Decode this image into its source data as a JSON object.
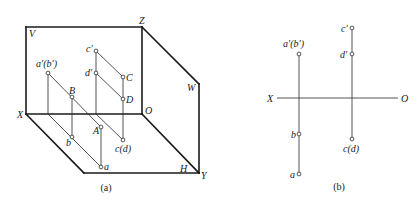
{
  "figure_a": {
    "caption": "(a)",
    "caption_pos": [
      106,
      191
    ],
    "frame_lines": [
      {
        "name": "v-plane-top",
        "p": [
          26,
          27,
          142,
          27
        ]
      },
      {
        "name": "v-plane-left",
        "p": [
          26,
          27,
          26,
          114
        ]
      },
      {
        "name": "z-axis",
        "p": [
          142,
          27,
          142,
          114
        ]
      },
      {
        "name": "x-axis",
        "p": [
          26,
          114,
          142,
          114
        ]
      },
      {
        "name": "w-plane-top",
        "p": [
          142,
          27,
          199,
          84
        ]
      },
      {
        "name": "w-plane-right",
        "p": [
          199,
          84,
          199,
          173
        ]
      },
      {
        "name": "y-axis",
        "p": [
          142,
          114,
          199,
          173
        ]
      },
      {
        "name": "h-plane-left",
        "p": [
          26,
          114,
          84,
          173
        ]
      },
      {
        "name": "h-plane-bottom",
        "p": [
          84,
          173,
          199,
          173
        ]
      }
    ],
    "thin_lines": [
      {
        "name": "ab-line-space",
        "p": [
          48,
          73,
          101,
          127
        ]
      },
      {
        "name": "ab-line-horizontal-projection",
        "p": [
          48,
          114,
          101,
          167
        ]
      },
      {
        "name": "a-prime-projector",
        "p": [
          48,
          73,
          48,
          114
        ]
      },
      {
        "name": "b-projector",
        "p": [
          72,
          97,
          72,
          137
        ]
      },
      {
        "name": "a-projector",
        "p": [
          101,
          127,
          101,
          167
        ]
      },
      {
        "name": "c-prime-c-line",
        "p": [
          96,
          51,
          123,
          77
        ]
      },
      {
        "name": "d-prime-d-line",
        "p": [
          96,
          73,
          123,
          99
        ]
      },
      {
        "name": "cd-horizontal-projection",
        "p": [
          96,
          114,
          123,
          140
        ]
      },
      {
        "name": "c-prime-projector",
        "p": [
          96,
          51,
          96,
          114
        ]
      },
      {
        "name": "cd-projector",
        "p": [
          123,
          77,
          123,
          140
        ]
      }
    ],
    "points": [
      {
        "name": "a-prime-b-prime",
        "x": 48,
        "y": 73
      },
      {
        "name": "B",
        "x": 72,
        "y": 97
      },
      {
        "name": "A",
        "x": 101,
        "y": 127
      },
      {
        "name": "b",
        "x": 72,
        "y": 137
      },
      {
        "name": "a",
        "x": 101,
        "y": 167
      },
      {
        "name": "c-prime",
        "x": 96,
        "y": 51
      },
      {
        "name": "d-prime",
        "x": 96,
        "y": 73
      },
      {
        "name": "C",
        "x": 123,
        "y": 77
      },
      {
        "name": "D",
        "x": 123,
        "y": 99
      },
      {
        "name": "c-d",
        "x": 123,
        "y": 140
      }
    ],
    "labels": [
      {
        "name": "label-V",
        "text": "V",
        "x": 29,
        "y": 37
      },
      {
        "name": "label-Z",
        "text": "Z",
        "x": 139,
        "y": 24
      },
      {
        "name": "label-W",
        "text": "W",
        "x": 187,
        "y": 91
      },
      {
        "name": "label-X",
        "text": "X",
        "x": 17,
        "y": 118
      },
      {
        "name": "label-O",
        "text": "O",
        "x": 145,
        "y": 114
      },
      {
        "name": "label-H",
        "text": "H",
        "x": 180,
        "y": 172
      },
      {
        "name": "label-Y",
        "text": "Y",
        "x": 201,
        "y": 179
      },
      {
        "name": "label-a-prime-b-prime",
        "text": "a′(b′)",
        "x": 36,
        "y": 67
      },
      {
        "name": "label-B",
        "text": "B",
        "x": 69,
        "y": 94
      },
      {
        "name": "label-A",
        "text": "A",
        "x": 93,
        "y": 134
      },
      {
        "name": "label-b",
        "text": "b",
        "x": 66,
        "y": 146
      },
      {
        "name": "label-a",
        "text": "a",
        "x": 104,
        "y": 170
      },
      {
        "name": "label-c-prime",
        "text": "c′",
        "x": 86,
        "y": 52
      },
      {
        "name": "label-d-prime",
        "text": "d′",
        "x": 85,
        "y": 76
      },
      {
        "name": "label-C",
        "text": "C",
        "x": 126,
        "y": 81
      },
      {
        "name": "label-D",
        "text": "D",
        "x": 126,
        "y": 103
      },
      {
        "name": "label-c-d",
        "text": "c(d)",
        "x": 115,
        "y": 152
      }
    ]
  },
  "figure_b": {
    "caption": "(b)",
    "caption_pos": [
      339,
      190
    ],
    "axis": {
      "p": [
        277,
        98,
        398,
        98
      ]
    },
    "thin_lines": [
      {
        "name": "ab-projection-line",
        "p": [
          299,
          54,
          299,
          174
        ]
      },
      {
        "name": "cd-projection-line",
        "p": [
          352,
          28,
          352,
          139
        ]
      }
    ],
    "points": [
      {
        "name": "a-prime-b-prime",
        "x": 299,
        "y": 54
      },
      {
        "name": "b",
        "x": 299,
        "y": 134
      },
      {
        "name": "a",
        "x": 299,
        "y": 174
      },
      {
        "name": "c-prime",
        "x": 352,
        "y": 28
      },
      {
        "name": "d-prime",
        "x": 352,
        "y": 54
      },
      {
        "name": "c-d",
        "x": 352,
        "y": 139
      }
    ],
    "labels": [
      {
        "name": "label-X",
        "text": "X",
        "x": 267,
        "y": 102
      },
      {
        "name": "label-O",
        "text": "O",
        "x": 401,
        "y": 102
      },
      {
        "name": "label-a-prime-b-prime",
        "text": "a′(b′)",
        "x": 283,
        "y": 47
      },
      {
        "name": "label-c-prime",
        "text": "c′",
        "x": 341,
        "y": 32
      },
      {
        "name": "label-d-prime",
        "text": "d′",
        "x": 340,
        "y": 58
      },
      {
        "name": "label-b",
        "text": "b",
        "x": 291,
        "y": 138
      },
      {
        "name": "label-a",
        "text": "a",
        "x": 290,
        "y": 178
      },
      {
        "name": "label-c-d",
        "text": "c(d)",
        "x": 343,
        "y": 152
      }
    ]
  }
}
